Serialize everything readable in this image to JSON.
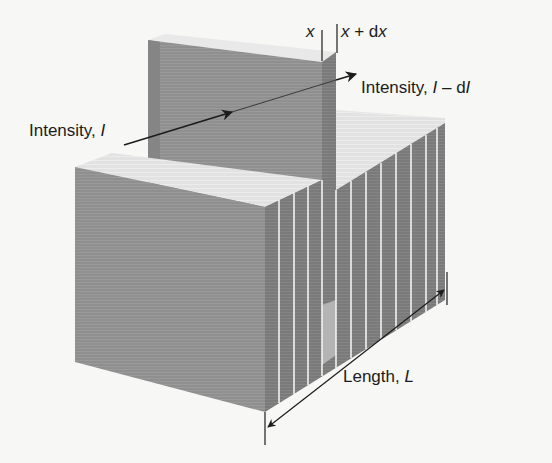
{
  "figure": {
    "type": "beer-lambert-slab-diagram",
    "colors": {
      "background": "#f7f7f5",
      "slab_front": "#8f8f8f",
      "slab_side": "#7d7d7d",
      "slab_dark_edge": "#6e6e6e",
      "slab_top": "#e4e4e4",
      "slice_divider": "#f2f2f2",
      "ink": "#1c1c1c"
    },
    "labels": {
      "x_pos": "x",
      "x_plus_dx": {
        "var": "x",
        "op": " + d",
        "var2": "x"
      },
      "intensity_in": {
        "text": "Intensity, ",
        "symbol": "I"
      },
      "intensity_out": {
        "text": "Intensity, ",
        "symbol": "I",
        "minus": " – d",
        "symbol2": "I"
      },
      "length": {
        "text": "Length, ",
        "symbol": "L"
      }
    },
    "slice_count": 12
  }
}
